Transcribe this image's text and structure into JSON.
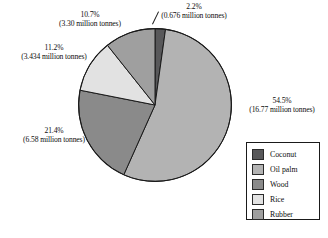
{
  "chart_data": {
    "type": "pie",
    "title": "",
    "legend_position": "bottom-right",
    "unit": "million tonnes",
    "categories": [
      "Coconut",
      "Oil palm",
      "Wood",
      "Rice",
      "Rubber"
    ],
    "values": [
      0.676,
      16.77,
      6.58,
      3.434,
      3.3
    ],
    "percentages": [
      2.2,
      54.5,
      21.4,
      11.2,
      10.7
    ],
    "colors": [
      "#58585a",
      "#b3b3b3",
      "#8a8a8a",
      "#e2e2e2",
      "#9f9f9f"
    ],
    "slices": [
      {
        "name": "Coconut",
        "percent": 2.2,
        "value": 0.676,
        "color": "#58585a",
        "label_pct": "2.2%",
        "label_amt": "(0.676 million tonnes)"
      },
      {
        "name": "Oil palm",
        "percent": 54.5,
        "value": 16.77,
        "color": "#b3b3b3",
        "label_pct": "54.5%",
        "label_amt": "(16.77 million tonnes)"
      },
      {
        "name": "Wood",
        "percent": 21.4,
        "value": 6.58,
        "color": "#8a8a8a",
        "label_pct": "21.4%",
        "label_amt": "(6.58 million tonnes)"
      },
      {
        "name": "Rice",
        "percent": 11.2,
        "value": 3.434,
        "color": "#e2e2e2",
        "label_pct": "11.2%",
        "label_amt": "(3.434 million tonnes)"
      },
      {
        "name": "Rubber",
        "percent": 10.7,
        "value": 3.3,
        "color": "#9f9f9f",
        "label_pct": "10.7%",
        "label_amt": "(3.30 million  tonnes)"
      }
    ]
  },
  "legend": {
    "items": [
      {
        "label": "Coconut",
        "color": "#58585a"
      },
      {
        "label": "Oil palm",
        "color": "#b3b3b3"
      },
      {
        "label": "Wood",
        "color": "#8a8a8a"
      },
      {
        "label": "Rice",
        "color": "#e2e2e2"
      },
      {
        "label": "Rubber",
        "color": "#9f9f9f"
      }
    ]
  }
}
